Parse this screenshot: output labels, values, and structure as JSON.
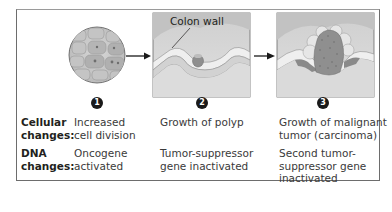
{
  "figure": {
    "callout_label": "Colon wall",
    "steps": [
      {
        "number": "1",
        "cellular": "Increased cell division",
        "dna": "Oncogene activated",
        "cellular_lines": [
          "Increased",
          "cell division"
        ],
        "dna_lines": [
          "Oncogene",
          "activated"
        ]
      },
      {
        "number": "2",
        "cellular": "Growth of polyp",
        "dna": "Tumor-suppressor gene inactivated",
        "cellular_lines": [
          "Growth of polyp"
        ],
        "dna_lines": [
          "Tumor-suppressor",
          "gene inactivated"
        ]
      },
      {
        "number": "3",
        "cellular": "Growth of malignant tumor (carcinoma)",
        "dna": "Second tumor-suppressor gene inactivated",
        "cellular_lines": [
          "Growth of malignant",
          "tumor (carcinoma)"
        ],
        "dna_lines": [
          "Second tumor-",
          "suppressor gene",
          "inactivated"
        ]
      }
    ],
    "row_labels": {
      "cellular": [
        "Cellular",
        "changes:"
      ],
      "dna": [
        "DNA",
        "changes:"
      ]
    },
    "colors": {
      "frame": "#6d6d6d",
      "tissue": "#c9c9c9",
      "tumor": "#8a8a8a",
      "arrow": "#1a1a1a",
      "step_badge": "#1a1a1a"
    }
  }
}
